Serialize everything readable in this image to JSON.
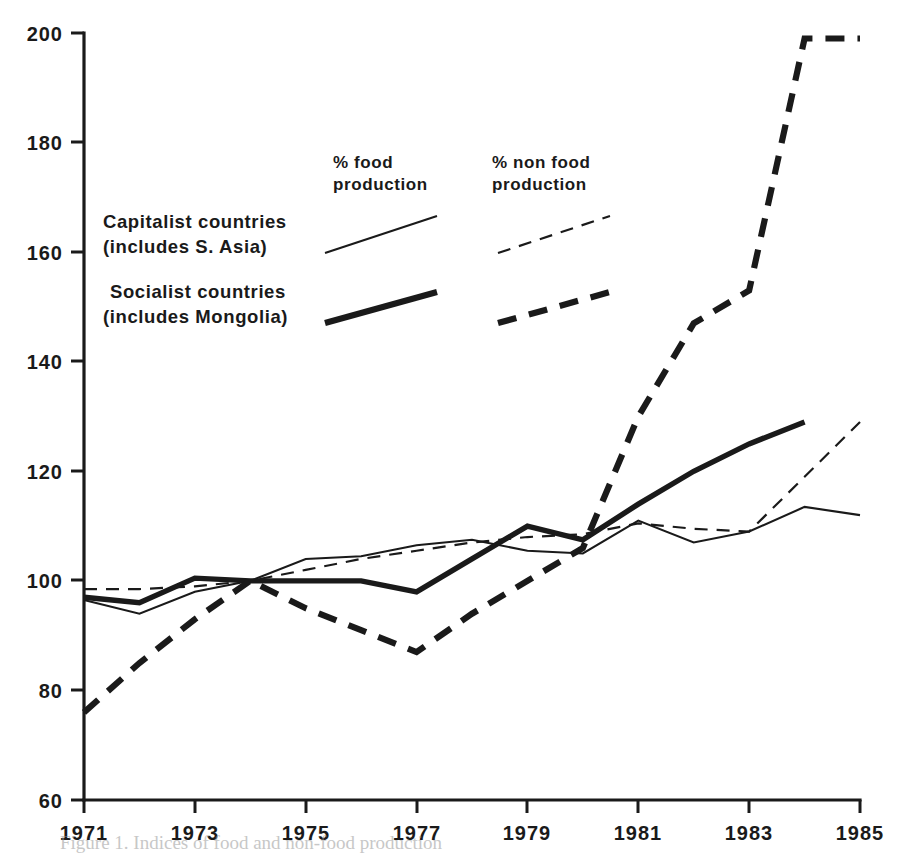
{
  "chart_data": {
    "type": "line",
    "title": "",
    "xlabel": "",
    "ylabel": "",
    "xlim": [
      1971,
      1985
    ],
    "ylim": [
      60,
      200
    ],
    "grid": false,
    "legend_position": "upper-left-inside",
    "x": [
      1971,
      1972,
      1973,
      1974,
      1975,
      1976,
      1977,
      1978,
      1979,
      1980,
      1981,
      1982,
      1983,
      1984,
      1985
    ],
    "y_ticks": [
      60,
      80,
      100,
      120,
      140,
      160,
      180,
      200
    ],
    "x_ticks": [
      1971,
      1973,
      1975,
      1977,
      1979,
      1981,
      1983,
      1985
    ],
    "x_tick_labels": [
      "1971",
      "1973",
      "1975",
      "1977",
      "1979",
      "1981",
      "1983",
      "1985"
    ],
    "y_tick_labels": [
      "60",
      "80",
      "100",
      "120",
      "140",
      "160",
      "180",
      "200"
    ],
    "series": [
      {
        "name": "Capitalist countries (includes S. Asia) — % food production",
        "short_name": "capitalist-food",
        "style": "thin-solid",
        "color": "#1a1a1a",
        "x": [
          1971,
          1972,
          1973,
          1974,
          1975,
          1976,
          1977,
          1978,
          1979,
          1980,
          1981,
          1982,
          1983,
          1984,
          1985
        ],
        "values": [
          96.5,
          94.0,
          98.0,
          100.0,
          104.0,
          104.5,
          106.5,
          107.5,
          105.5,
          105.0,
          111.0,
          107.0,
          109.0,
          113.5,
          112.0
        ]
      },
      {
        "name": "Capitalist countries (includes S. Asia) — % non food production",
        "short_name": "capitalist-nonfood",
        "style": "thin-dashed",
        "color": "#1a1a1a",
        "x": [
          1971,
          1972,
          1973,
          1974,
          1975,
          1976,
          1977,
          1978,
          1979,
          1980,
          1981,
          1982,
          1983,
          1984,
          1985
        ],
        "values": [
          98.5,
          98.5,
          99.0,
          100.0,
          102.0,
          104.0,
          105.5,
          107.0,
          108.0,
          108.5,
          110.5,
          109.5,
          109.0,
          119.0,
          129.0
        ]
      },
      {
        "name": "Socialist countries (includes Mongolia) — % food production",
        "short_name": "socialist-food",
        "style": "thick-solid",
        "color": "#1a1a1a",
        "x": [
          1971,
          1972,
          1973,
          1974,
          1975,
          1976,
          1977,
          1978,
          1979,
          1980,
          1981,
          1982,
          1983,
          1984
        ],
        "values": [
          97.0,
          96.0,
          100.5,
          100.0,
          100.0,
          100.0,
          98.0,
          104.0,
          110.0,
          107.5,
          114.0,
          120.0,
          125.0,
          129.0
        ]
      },
      {
        "name": "Socialist countries (includes Mongolia) — % non food production",
        "short_name": "socialist-nonfood",
        "style": "thick-dashed",
        "color": "#1a1a1a",
        "x": [
          1971,
          1972,
          1973,
          1974,
          1975,
          1976,
          1977,
          1978,
          1979,
          1980,
          1981,
          1982,
          1983,
          1984,
          1985
        ],
        "values": [
          76.0,
          85.0,
          93.0,
          100.0,
          95.0,
          91.0,
          87.0,
          94.0,
          100.0,
          106.0,
          130.0,
          147.0,
          153.0,
          199.0,
          199.0
        ]
      }
    ]
  },
  "legend": {
    "column_headers": [
      {
        "id": "food",
        "line1": "% food",
        "line2": "production"
      },
      {
        "id": "nonfood",
        "line1": "% non food",
        "line2": "production"
      }
    ],
    "rows": [
      {
        "id": "capitalist",
        "line1": "Capitalist countries",
        "line2": "(includes S. Asia)"
      },
      {
        "id": "socialist",
        "line1": "Socialist  countries",
        "line2": "(includes Mongolia)"
      }
    ]
  },
  "colors": {
    "ink": "#1a1a1a",
    "paper": "#ffffff"
  },
  "caption": {
    "text": "Figure 1. Indices of food and non-food production"
  }
}
